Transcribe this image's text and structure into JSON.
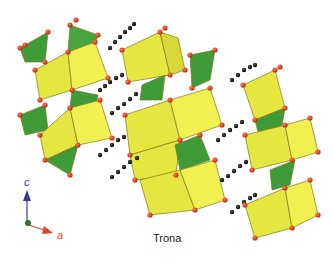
{
  "figure": {
    "title": "Trona",
    "axes": {
      "c_label": "c",
      "a_label": "a"
    },
    "colors": {
      "octahedra": "#e6e640",
      "prisms": "#3f9a38",
      "oxygen": "#d23a1a",
      "carbon": "#111111",
      "c_axis": "#3b3aa0",
      "a_axis": "#e0442a",
      "origin": "#2e6b2e"
    }
  }
}
